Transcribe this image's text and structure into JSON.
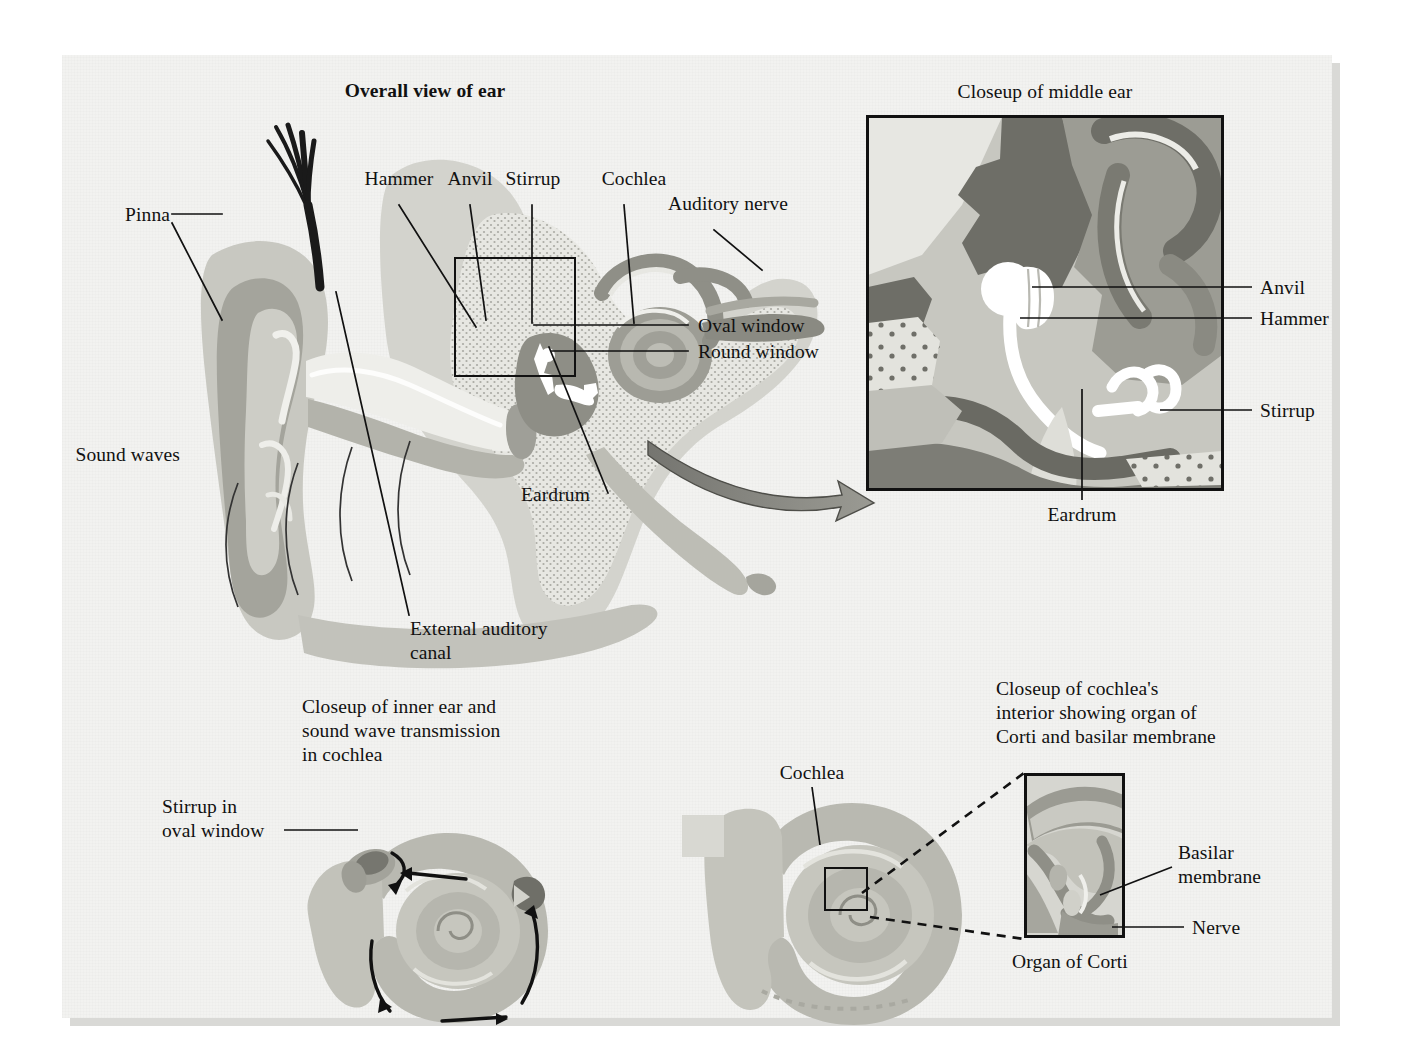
{
  "figure": {
    "background_color": "#f2f2f0",
    "ink_color": "#111111"
  },
  "panels": {
    "overall": {
      "title": "Overall view of ear",
      "labels": {
        "pinna": "Pinna",
        "sound_waves": "Sound waves",
        "external_auditory_canal_line1": "External auditory",
        "external_auditory_canal_line2": "canal",
        "hammer": "Hammer",
        "anvil": "Anvil",
        "stirrup": "Stirrup",
        "cochlea": "Cochlea",
        "auditory_nerve": "Auditory nerve",
        "oval_window": "Oval window",
        "round_window": "Round window",
        "eardrum": "Eardrum"
      }
    },
    "middle_ear_closeup": {
      "title": "Closeup of middle ear",
      "labels": {
        "anvil": "Anvil",
        "hammer": "Hammer",
        "stirrup": "Stirrup",
        "eardrum": "Eardrum"
      }
    },
    "inner_ear_closeup": {
      "title_line1": "Closeup of inner ear and",
      "title_line2": "sound wave transmission",
      "title_line3": "in cochlea",
      "labels": {
        "stirrup_in_oval_window_line1": "Stirrup in",
        "stirrup_in_oval_window_line2": "oval window"
      }
    },
    "cochlea_interior": {
      "title_line1": "Closeup of cochlea's",
      "title_line2": "interior showing organ of",
      "title_line3": "Corti and basilar membrane",
      "labels": {
        "cochlea": "Cochlea",
        "basilar_membrane_line1": "Basilar",
        "basilar_membrane_line2": "membrane",
        "nerve": "Nerve",
        "organ_of_corti": "Organ of Corti"
      }
    }
  },
  "palette": {
    "tissue_light": "#d9d9d4",
    "tissue_mid": "#bdbdb6",
    "tissue_dark": "#9a9a93",
    "tissue_darker": "#7d7d76",
    "bone_stipple": "#e6e6e1",
    "highlight": "#f4f4f0",
    "white_ossicle": "#ffffff",
    "arrow_gray": "#8c8c85",
    "hair_black": "#1a1a1a"
  }
}
